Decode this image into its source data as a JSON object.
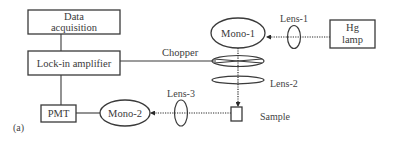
{
  "diagram": {
    "panel_label": "(a)",
    "boxes": {
      "data_acquisition": {
        "line1": "Data",
        "line2": "acquisition"
      },
      "lockin": {
        "label": "Lock-in amplifier"
      },
      "pmt": {
        "label": "PMT"
      },
      "hg_lamp": {
        "line1": "Hg",
        "line2": "lamp"
      },
      "sample": {
        "label": "Sample"
      }
    },
    "monochromators": {
      "mono1": {
        "label": "Mono-1"
      },
      "mono2": {
        "label": "Mono-2"
      }
    },
    "lenses": {
      "lens1": {
        "label": "Lens-1"
      },
      "lens2": {
        "label": "Lens-2"
      },
      "lens3": {
        "label": "Lens-3"
      }
    },
    "chopper": {
      "label": "Chopper"
    },
    "colors": {
      "stroke": "#3a3a3a",
      "text": "#3a3a3a",
      "background": "#ffffff"
    }
  }
}
